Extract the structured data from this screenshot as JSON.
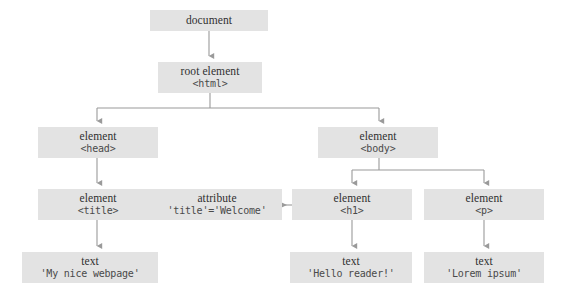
{
  "diagram": {
    "colors": {
      "node_fill": "#e3e3e3",
      "connector": "#9a9a9a",
      "type_text": "#303030",
      "code_text": "#4a4a4a",
      "background": "#ffffff"
    },
    "nodes": [
      {
        "id": "document",
        "type_label": "document",
        "code_label": "",
        "x": 150,
        "y": 10,
        "w": 118,
        "h": 21
      },
      {
        "id": "html",
        "type_label": "root element",
        "code_label": "<html>",
        "x": 158,
        "y": 62,
        "w": 104,
        "h": 31
      },
      {
        "id": "head",
        "type_label": "element",
        "code_label": "<head>",
        "x": 38,
        "y": 127,
        "w": 120,
        "h": 31
      },
      {
        "id": "body",
        "type_label": "element",
        "code_label": "<body>",
        "x": 318,
        "y": 127,
        "w": 120,
        "h": 31
      },
      {
        "id": "title",
        "type_label": "element",
        "code_label": "<title>",
        "x": 38,
        "y": 189,
        "w": 120,
        "h": 31
      },
      {
        "id": "attribute",
        "type_label": "attribute",
        "code_label": "'title'='Welcome'",
        "x": 152,
        "y": 189,
        "w": 130,
        "h": 31
      },
      {
        "id": "h1",
        "type_label": "element",
        "code_label": "<h1>",
        "x": 292,
        "y": 189,
        "w": 120,
        "h": 31
      },
      {
        "id": "p",
        "type_label": "element",
        "code_label": "<p>",
        "x": 424,
        "y": 189,
        "w": 120,
        "h": 31
      },
      {
        "id": "text-title",
        "type_label": "text",
        "code_label": "'My nice webpage'",
        "x": 22,
        "y": 252,
        "w": 136,
        "h": 31
      },
      {
        "id": "text-h1",
        "type_label": "text",
        "code_label": "'Hello reader!'",
        "x": 290,
        "y": 252,
        "w": 122,
        "h": 31
      },
      {
        "id": "text-p",
        "type_label": "text",
        "code_label": "'Lorem ipsum'",
        "x": 424,
        "y": 252,
        "w": 120,
        "h": 31
      }
    ],
    "edges": [
      {
        "from": "document",
        "to": "html",
        "style": "straight-down"
      },
      {
        "from": "html",
        "to": "head",
        "style": "elbow-left"
      },
      {
        "from": "html",
        "to": "body",
        "style": "elbow-right"
      },
      {
        "from": "head",
        "to": "title",
        "style": "straight-down"
      },
      {
        "from": "body",
        "to": "h1",
        "style": "elbow-left"
      },
      {
        "from": "body",
        "to": "p",
        "style": "elbow-right"
      },
      {
        "from": "h1",
        "to": "attribute",
        "style": "arrow-left"
      },
      {
        "from": "title",
        "to": "text-title",
        "style": "straight-down"
      },
      {
        "from": "h1",
        "to": "text-h1",
        "style": "straight-down"
      },
      {
        "from": "p",
        "to": "text-p",
        "style": "straight-down"
      }
    ]
  }
}
